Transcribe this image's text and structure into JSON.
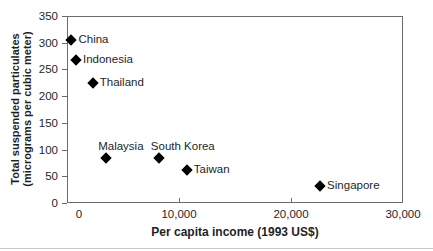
{
  "chart_data": {
    "type": "scatter",
    "title": "",
    "xlabel": "Per capita income (1993 US$)",
    "ylabel_line1": "Total suspended particulates",
    "ylabel_line2": "(micrograms per cubic meter)",
    "xlim": [
      0,
      30000
    ],
    "ylim": [
      0,
      350
    ],
    "grid": false,
    "legend": false,
    "marker": "diamond",
    "x_ticks": [
      {
        "value": 0,
        "label": "0"
      },
      {
        "value": 10000,
        "label": "10,000"
      },
      {
        "value": 20000,
        "label": "20,000"
      },
      {
        "value": 30000,
        "label": "30,000"
      }
    ],
    "y_ticks": [
      {
        "value": 0,
        "label": "0"
      },
      {
        "value": 50,
        "label": "50"
      },
      {
        "value": 100,
        "label": "100"
      },
      {
        "value": 150,
        "label": "150"
      },
      {
        "value": 200,
        "label": "200"
      },
      {
        "value": 250,
        "label": "250"
      },
      {
        "value": 300,
        "label": "300"
      },
      {
        "value": 350,
        "label": "350"
      }
    ],
    "points": [
      {
        "label": "China",
        "x": 400,
        "y": 305,
        "label_position": "right"
      },
      {
        "label": "Indonesia",
        "x": 800,
        "y": 268,
        "label_position": "right"
      },
      {
        "label": "Thailand",
        "x": 2300,
        "y": 224,
        "label_position": "right"
      },
      {
        "label": "Malaysia",
        "x": 3500,
        "y": 84,
        "label_position": "above"
      },
      {
        "label": "South Korea",
        "x": 8200,
        "y": 84,
        "label_position": "above"
      },
      {
        "label": "Taiwan",
        "x": 10700,
        "y": 62,
        "label_position": "right"
      },
      {
        "label": "Singapore",
        "x": 22600,
        "y": 31,
        "label_position": "right"
      }
    ]
  },
  "colors": {
    "axis": "#6b6b6b",
    "text": "#1f1f1f",
    "marker": "#000000",
    "background": "#ffffff",
    "bottom_rule": "#c9c9c9"
  }
}
